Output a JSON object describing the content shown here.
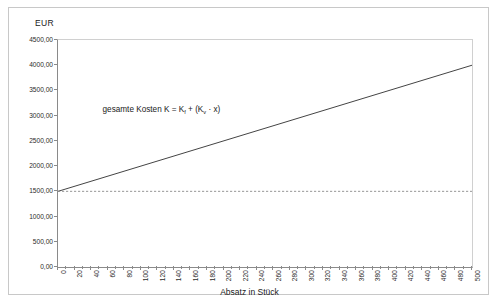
{
  "chart_data": {
    "type": "line",
    "title": "",
    "xlabel": "Absatz in Stück",
    "ylabel": "EUR",
    "xlim": [
      0,
      500
    ],
    "ylim": [
      0,
      4500
    ],
    "grid": false,
    "legend": "none",
    "x_tick_step": 20,
    "x_minor_tick_step": 10,
    "y_tick_step": 500,
    "xticklabels": [
      "0",
      "20",
      "40",
      "60",
      "80",
      "100",
      "120",
      "140",
      "160",
      "180",
      "200",
      "220",
      "240",
      "260",
      "280",
      "300",
      "320",
      "340",
      "360",
      "380",
      "400",
      "420",
      "440",
      "460",
      "480",
      "500"
    ],
    "yticklabels": [
      "0,00",
      "500,00",
      "1000,00",
      "1500,00",
      "2000,00",
      "2500,00",
      "3000,00",
      "3500,00",
      "4000,00",
      "4500,00"
    ],
    "x": [
      0,
      500
    ],
    "series": [
      {
        "name": "gesamte Kosten",
        "style": "solid",
        "color": "#444444",
        "values": [
          1500,
          4000
        ]
      },
      {
        "name": "fixe Kosten",
        "style": "dashed",
        "color": "#8a8a8a",
        "values": [
          1500,
          1500
        ]
      }
    ],
    "annotations": [
      {
        "name": "cost-function-formula",
        "text_plain": "gesamte Kosten K = Kf + (Kv · x)",
        "prefix": "gesamte Kosten K = K",
        "sub1": "f",
        "middle": " + (K",
        "sub2": "v",
        "suffix": " · x)",
        "x_value": 55,
        "y_value": 3200
      }
    ]
  },
  "colors": {
    "card_border": "#c8c8c8",
    "axis": "#8a8a8a",
    "plot_frame": "#d0d0d0",
    "text": "#1a1a1a",
    "cost_line": "#444444",
    "fixed_line": "#8a8a8a"
  }
}
